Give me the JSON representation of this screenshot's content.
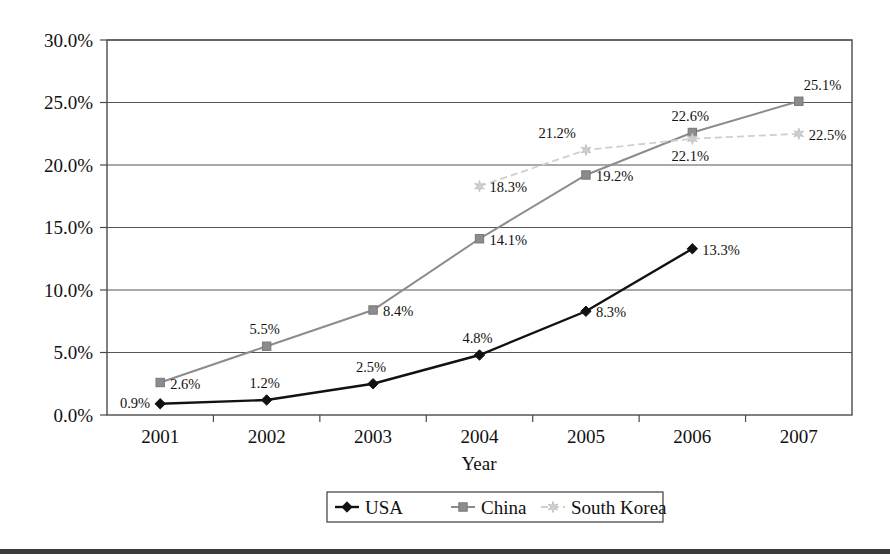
{
  "chart_data": {
    "type": "line",
    "title": "",
    "xlabel": "Year",
    "ylabel": "",
    "categories": [
      "2001",
      "2002",
      "2003",
      "2004",
      "2005",
      "2006",
      "2007"
    ],
    "ylim": [
      0,
      30
    ],
    "ytick_values": [
      0,
      5,
      10,
      15,
      20,
      25,
      30
    ],
    "ytick_labels": [
      "0.0%",
      "5.0%",
      "10.0%",
      "15.0%",
      "20.0%",
      "25.0%",
      "30.0%"
    ],
    "grid": "horizontal",
    "legend_position": "bottom-center",
    "series": [
      {
        "name": "USA",
        "color": "#121212",
        "marker": "diamond",
        "line_style": "solid",
        "values": [
          0.9,
          1.2,
          2.5,
          4.8,
          8.3,
          13.3,
          null
        ],
        "point_labels": [
          {
            "category": "2001",
            "value": 0.9,
            "text": "0.9%",
            "placement": "left"
          },
          {
            "category": "2002",
            "value": 1.2,
            "text": "1.2%",
            "placement": "above"
          },
          {
            "category": "2003",
            "value": 2.5,
            "text": "2.5%",
            "placement": "above"
          },
          {
            "category": "2004",
            "value": 4.8,
            "text": "4.8%",
            "placement": "above"
          },
          {
            "category": "2005",
            "value": 8.3,
            "text": "8.3%",
            "placement": "right"
          },
          {
            "category": "2006",
            "value": 13.3,
            "text": "13.3%",
            "placement": "right"
          }
        ]
      },
      {
        "name": "China",
        "color": "#8c8c8c",
        "marker": "square",
        "line_style": "solid",
        "values": [
          2.6,
          5.5,
          8.4,
          14.1,
          19.2,
          22.6,
          25.1
        ],
        "point_labels": [
          {
            "category": "2001",
            "value": 2.6,
            "text": "2.6%",
            "placement": "right"
          },
          {
            "category": "2002",
            "value": 5.5,
            "text": "5.5%",
            "placement": "above"
          },
          {
            "category": "2003",
            "value": 8.4,
            "text": "8.4%",
            "placement": "right"
          },
          {
            "category": "2004",
            "value": 14.1,
            "text": "14.1%",
            "placement": "right"
          },
          {
            "category": "2005",
            "value": 19.2,
            "text": "19.2%",
            "placement": "right"
          },
          {
            "category": "2006",
            "value": 22.6,
            "text": "22.6%",
            "placement": "above"
          },
          {
            "category": "2007",
            "value": 25.1,
            "text": "25.1%",
            "placement": "above-right"
          }
        ]
      },
      {
        "name": "South Korea",
        "color": "#cfcfcf",
        "marker": "star",
        "line_style": "dashed",
        "values": [
          null,
          null,
          null,
          18.3,
          21.2,
          22.1,
          22.5
        ],
        "point_labels": [
          {
            "category": "2004",
            "value": 18.3,
            "text": "18.3%",
            "placement": "right"
          },
          {
            "category": "2005",
            "value": 21.2,
            "text": "21.2%",
            "placement": "above-left"
          },
          {
            "category": "2006",
            "value": 22.1,
            "text": "22.1%",
            "placement": "below"
          },
          {
            "category": "2007",
            "value": 22.5,
            "text": "22.5%",
            "placement": "right"
          }
        ]
      }
    ]
  },
  "legend": {
    "items": [
      {
        "label": "USA",
        "marker": "diamond",
        "color": "#121212"
      },
      {
        "label": "China",
        "marker": "square",
        "color": "#8c8c8c"
      },
      {
        "label": "South Korea",
        "marker": "star",
        "color": "#cfcfcf"
      }
    ]
  }
}
